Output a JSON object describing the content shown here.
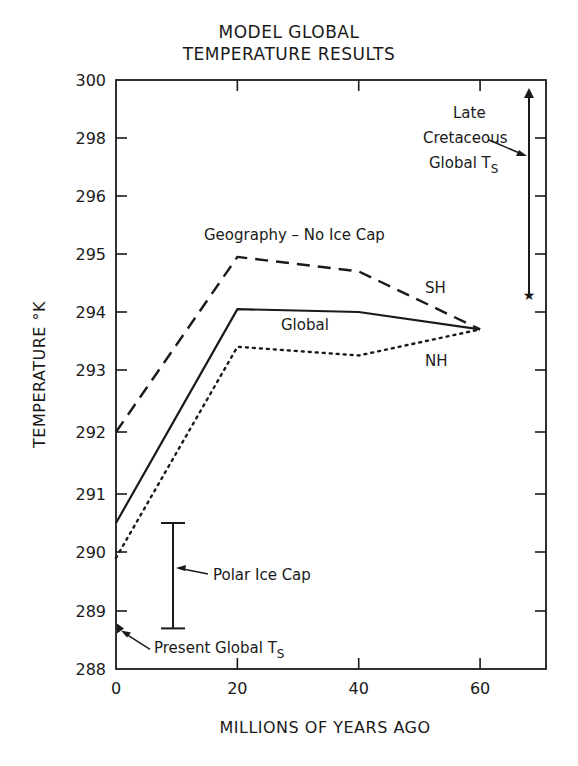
{
  "title_line1": "MODEL GLOBAL",
  "title_line2": "TEMPERATURE RESULTS",
  "chart_data": {
    "type": "line",
    "xlabel": "MILLIONS OF YEARS AGO",
    "ylabel": "TEMPERATURE °K",
    "xlim": [
      0,
      70
    ],
    "ylim": [
      288,
      300
    ],
    "x_ticks": [
      0,
      20,
      40,
      60
    ],
    "y_ticks": [
      288,
      289,
      290,
      291,
      292,
      293,
      294,
      295,
      296,
      298,
      300
    ],
    "y_axis_note": "non-linear scale above 295 (296, 298, 300 compressed)",
    "grid": false,
    "annotation_top": "Geography - No Ice Cap",
    "x": [
      0,
      20,
      40,
      60
    ],
    "series": [
      {
        "name": "SH",
        "style": "dashed",
        "values": [
          292.0,
          294.95,
          294.7,
          293.7
        ]
      },
      {
        "name": "Global",
        "style": "solid",
        "values": [
          290.5,
          294.05,
          294.0,
          293.7
        ]
      },
      {
        "name": "NH",
        "style": "dotted",
        "values": [
          289.9,
          293.4,
          293.25,
          293.7
        ]
      }
    ],
    "annotations": [
      {
        "label": "Polar Ice Cap",
        "type": "range_bar",
        "x": 9,
        "y_low": 288.7,
        "y_high": 290.5
      },
      {
        "label": "Present Global Ts",
        "type": "point",
        "x": 0,
        "y": 288.7
      },
      {
        "label_lines": [
          "Late",
          "Cretaceous",
          "Global Ts"
        ],
        "type": "range_arrow",
        "x": 67,
        "y_low": 294.3,
        "y_high": 300
      }
    ]
  },
  "labels": {
    "geography": "Geography – No Ice Cap",
    "sh": "SH",
    "global": "Global",
    "nh": "NH",
    "polar_ice_cap": "Polar Ice Cap",
    "present_global": "Present Global T",
    "present_global_sub": "S",
    "late": "Late",
    "cretaceous": "Cretaceous",
    "cretaceous_global": "Global T",
    "cretaceous_global_sub": "S"
  }
}
